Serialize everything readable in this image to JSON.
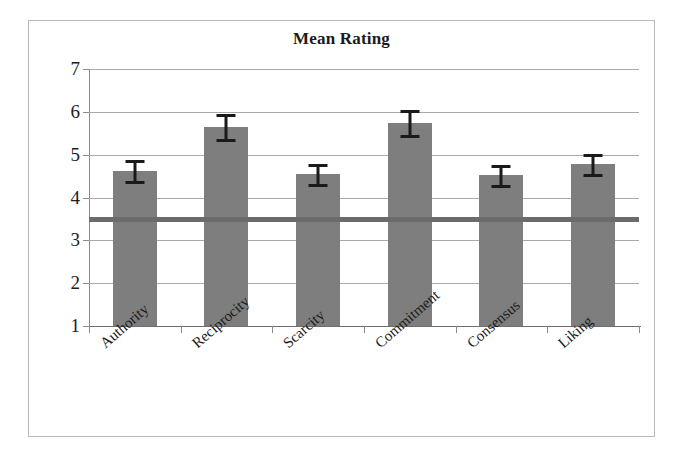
{
  "figure": {
    "title": "Mean Rating"
  },
  "chart_data": {
    "type": "bar",
    "title": "Mean Rating",
    "xlabel": "",
    "ylabel": "",
    "ylim": [
      1,
      7
    ],
    "yticks": [
      1,
      2,
      3,
      4,
      5,
      6,
      7
    ],
    "ytick_labels": [
      "1",
      "2",
      "3",
      "4",
      "5",
      "6",
      "7"
    ],
    "grid": true,
    "legend": false,
    "categories": [
      "Authority",
      "Reciprocity",
      "Scarcity",
      "Commitment",
      "Consensus",
      "Liking"
    ],
    "values": [
      4.63,
      5.65,
      4.55,
      5.75,
      4.52,
      4.78
    ],
    "errors": [
      0.24,
      0.29,
      0.23,
      0.29,
      0.23,
      0.24
    ],
    "error_type": "symmetric",
    "annotations": [
      {
        "name": "scale-midpoint-reference-line",
        "kind": "horizontal-line",
        "y": 3.5,
        "color": "#6b6b6b"
      }
    ],
    "bar_color": "#7e7e7e",
    "errorbar_color": "#1a1a1a"
  }
}
